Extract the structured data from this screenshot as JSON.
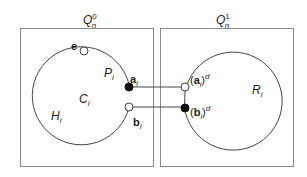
{
  "left_region": {
    "title": "Q",
    "title_sub": "n",
    "title_sup": "0",
    "cycle_label": "C",
    "cycle_label_sub": "i",
    "path_label": "P",
    "path_label_sub": "i",
    "arc_label": "H",
    "arc_label_sub": "i",
    "vertex_e": "e",
    "vertex_a": "a",
    "vertex_a_sub": "i",
    "vertex_b": "b",
    "vertex_b_sub": "i"
  },
  "right_region": {
    "title": "Q",
    "title_sub": "n",
    "title_sup": "1",
    "cycle_label": "R",
    "cycle_label_sub": "i",
    "vertex_ad_open": "(",
    "vertex_ad": "a",
    "vertex_ad_sub": "i",
    "vertex_ad_close": ")",
    "vertex_ad_sup": "d",
    "vertex_bd_open": "(",
    "vertex_bd": "b",
    "vertex_bd_sub": "i",
    "vertex_bd_close": ")",
    "vertex_bd_sup": "d"
  },
  "colors": {
    "stroke": "#444444",
    "box": "#888888",
    "filled_vertex": "#111111",
    "open_vertex": "#ffffff"
  }
}
